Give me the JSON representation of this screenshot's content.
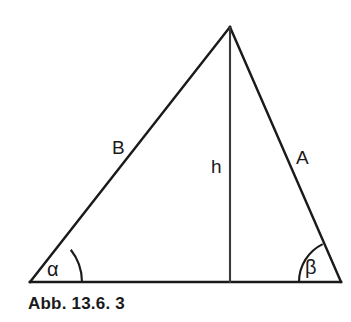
{
  "figure": {
    "caption": "Abb. 13.6. 3",
    "background_color": "#ffffff",
    "stroke_color": "#1a1a1a",
    "text_color": "#1a1a1a"
  },
  "diagram": {
    "type": "triangle-with-altitude",
    "vertices": {
      "apex": {
        "x": 230,
        "y": 27
      },
      "bottom_left": {
        "x": 30,
        "y": 282
      },
      "bottom_right": {
        "x": 341,
        "y": 282
      }
    },
    "altitude_foot": {
      "x": 230,
      "y": 282
    },
    "labels": {
      "side_left": "B",
      "side_right": "A",
      "height": "h",
      "angle_left": "α",
      "angle_right": "β"
    },
    "label_positions": {
      "side_left": {
        "x": 112,
        "y": 154
      },
      "side_right": {
        "x": 296,
        "y": 164
      },
      "height": {
        "x": 211,
        "y": 173
      },
      "angle_left": {
        "x": 47,
        "y": 276
      },
      "angle_right": {
        "x": 305,
        "y": 274
      }
    },
    "angle_arcs": {
      "left_radius": 52,
      "right_radius": 42
    }
  }
}
